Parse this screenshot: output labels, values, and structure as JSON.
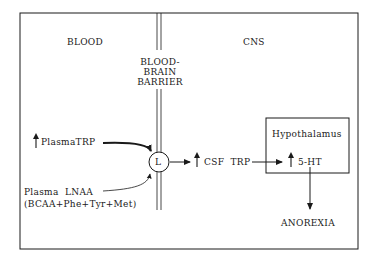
{
  "diagram": {
    "regions": {
      "blood": "BLOOD",
      "barrier": [
        "BLOOD-",
        "BRAIN",
        "BARRIER"
      ],
      "cns": "CNS"
    },
    "nodes": {
      "plasma_trp": "PlasmaTRP",
      "plasma_lnaa_line1": "Plasma  LNAA",
      "plasma_lnaa_line2": "(BCAA+Phe+Tyr+Met)",
      "transporter": "L",
      "csf_trp": "CSF  TRP",
      "hypothalamus": "Hypothalamus",
      "serotonin": "5-HT",
      "anorexia": "ANOREXIA"
    },
    "edges": [
      {
        "from": "plasma_trp",
        "to": "transporter",
        "style": "thick-curved"
      },
      {
        "from": "plasma_lnaa",
        "to": "transporter",
        "style": "thin-curved"
      },
      {
        "from": "transporter",
        "to": "csf_trp",
        "style": "straight"
      },
      {
        "from": "csf_trp",
        "to": "serotonin",
        "style": "straight"
      },
      {
        "from": "serotonin",
        "to": "anorexia",
        "style": "straight-down"
      }
    ],
    "increase_markers": [
      "plasma_trp",
      "csf_trp",
      "serotonin"
    ],
    "colors": {
      "ink": "#1a1a1a",
      "background": "#ffffff"
    }
  }
}
